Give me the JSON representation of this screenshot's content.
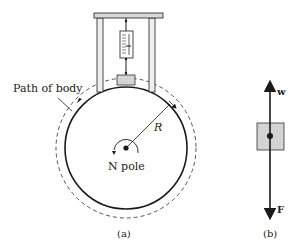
{
  "figure_a": {
    "path_label": "Path of body",
    "radius_label": "R",
    "pole_label": "N pole",
    "caption": "(a)"
  },
  "figure_b": {
    "upper_force_label": "w",
    "lower_force_label": "F",
    "caption": "(b)"
  },
  "colors": {
    "line": "#1a1a1a",
    "body_fill": "#d9d9d9",
    "dashed": "#555555"
  }
}
